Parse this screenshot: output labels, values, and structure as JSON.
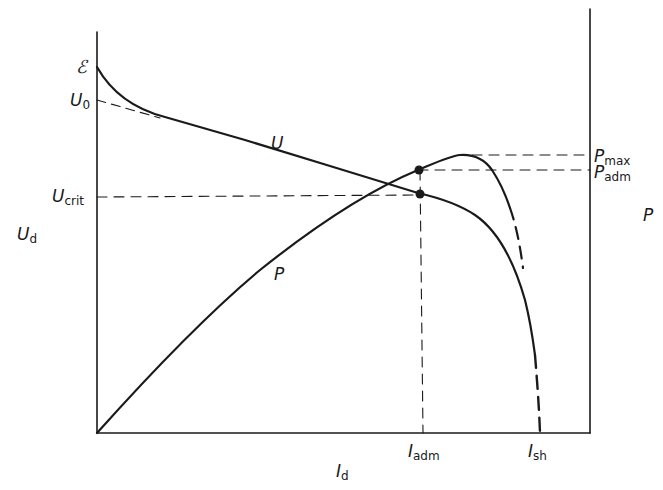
{
  "diagram": {
    "type": "characteristic-curves",
    "axes": {
      "x_label": {
        "main": "I",
        "sub": "d"
      },
      "y_left_label": {
        "main": "U",
        "sub": "d"
      },
      "y_right_label": "P"
    },
    "left_axis_ticks": [
      {
        "id": "emf",
        "main": "ℰ",
        "sub": ""
      },
      {
        "id": "u0",
        "main": "U",
        "sub": "0"
      },
      {
        "id": "ucrit",
        "main": "U",
        "sub": "crit"
      }
    ],
    "right_axis_ticks": [
      {
        "id": "pmax",
        "main": "P",
        "sub": "max"
      },
      {
        "id": "padm",
        "main": "P",
        "sub": "adm"
      }
    ],
    "bottom_axis_ticks": [
      {
        "id": "iadm",
        "main": "I",
        "sub": "adm"
      },
      {
        "id": "ish",
        "main": "I",
        "sub": "sh"
      }
    ],
    "curve_labels": {
      "voltage": "U",
      "power": "P"
    },
    "colors": {
      "ink": "#1a1a1a",
      "background": "#ffffff"
    }
  }
}
